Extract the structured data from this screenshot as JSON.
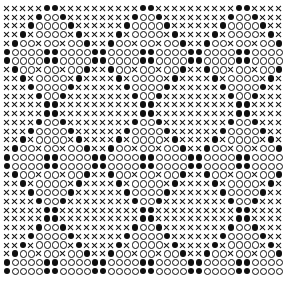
{
  "figure": {
    "background_color": "#ffffff",
    "ink_color": "#101010",
    "grid": {
      "columns": 35,
      "rows": 31,
      "cell_width_px": 8.0,
      "cell_height_px": 8.77,
      "origin_x_px": 3,
      "origin_y_px": 4,
      "period_x": 11,
      "period_y": 11
    },
    "legend": [
      {
        "key": "x",
        "symbol": "X",
        "name": "cross-glyph",
        "fill": "none"
      },
      {
        "key": "o",
        "symbol": "O",
        "name": "open-circle-glyph",
        "fill": "#ffffff"
      },
      {
        "key": "f",
        "symbol": "●",
        "name": "filled-circle-glyph",
        "fill": "#101010"
      }
    ]
  },
  "chart_data": {
    "type": "heatmap",
    "xlabel": "",
    "ylabel": "",
    "categories": [],
    "legend_position": "none",
    "grid": false,
    "symbols": [
      "x",
      "o",
      "f"
    ],
    "rows": [
      "xxxxxffxxxxxxxxxxffxxxxxxxxxxffxxxx",
      "xxxxfoofxxxxxxxxfoofxxxxxxxxfoofxxxx",
      "xxxfoooofxxxxxxfoooofxxxxxxfoooofxxx",
      "xxfxooooxfxxxxfxooooxfxxxxfxooooxfxx",
      "xfooxooxoofxxfooxooxoofxxfooxooxoofx",
      "fooooffooooffooooffooooffooooffoooof",
      "fooooffooooffooooffooooffooooffoooof",
      "xfooxooxoofxxfooxooxoofxxfooxooxoofx",
      "xxfxooooxfxxxxfxooooxfxxxxfxooooxfxx",
      "xxxfoooofxxxxxxfoooofxxxxxxfoooofxxx",
      "xxxxfoofxxxxxxxxfoofxxxxxxxxfoofxxxx",
      "xxxxxffxxxxxxxxxxffxxxxxxxxxxffxxxx",
      "xxxxxffxxxxxxxxxxffxxxxxxxxxxffxxxx",
      "xxxxfoofxxxxxxxxfoofxxxxxxxxfoofxxxx",
      "xxxfoooofxxxxxxfoooofxxxxxxfoooofxxx",
      "xxfxooooxfxxxxfxooooxfxxxxfxooooxfxx",
      "xfooxooxoofxxfooxooxoofxxfooxooxoofx",
      "fooooffooooffooooffooooffooooffoooof",
      "fooooffooooffooooffooooffooooffoooof",
      "xfooxooxoofxxfooxooxoofxxfooxooxoofx",
      "xxfxooooxfxxxxfxooooxfxxxxfxooooxfxx",
      "xxxfoooofxxxxxxfoooofxxxxxxfoooofxxx",
      "xxxxfoofxxxxxxxxfoofxxxxxxxxfoofxxxx",
      "xxxxxffxxxxxxxxxxffxxxxxxxxxxffxxxx",
      "xxxxxffxxxxxxxxxxffxxxxxxxxxxffxxxx",
      "xxxxfoofxxxxxxxxfoofxxxxxxxxfoofxxxx",
      "xxxfoooofxxxxxxfoooofxxxxxxfoooofxxx",
      "xxfxooooxfxxxxfxooooxfxxxxfxooooxfxx",
      "xfooxooxoofxxfooxooxoofxxfooxooxoofx",
      "fooooffooooffooooffooooffooooffoooof",
      "fooooffooooffooooffooooffooooffoooof"
    ]
  }
}
